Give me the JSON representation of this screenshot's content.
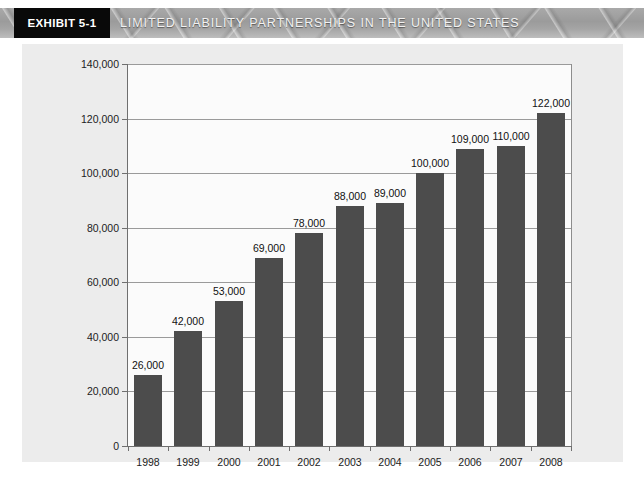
{
  "header": {
    "exhibit_tag": "EXHIBIT 5-1",
    "title": "LIMITED LIABILITY PARTNERSHIPS IN THE UNITED STATES",
    "tag_bg": "#090909",
    "band_bg": "#9b9b9b",
    "title_color": "#f2f2f2"
  },
  "chart_data": {
    "type": "bar",
    "title": "LIMITED LIABILITY PARTNERSHIPS IN THE UNITED STATES",
    "xlabel": "",
    "ylabel": "",
    "categories": [
      "1998",
      "1999",
      "2000",
      "2001",
      "2002",
      "2003",
      "2004",
      "2005",
      "2006",
      "2007",
      "2008"
    ],
    "values": [
      26000,
      42000,
      53000,
      69000,
      78000,
      88000,
      89000,
      100000,
      109000,
      110000,
      122000
    ],
    "value_labels": [
      "26,000",
      "42,000",
      "53,000",
      "69,000",
      "78,000",
      "88,000",
      "89,000",
      "100,000",
      "109,000",
      "110,000",
      "122,000"
    ],
    "ylim": [
      0,
      140000
    ],
    "ytick_values": [
      0,
      20000,
      40000,
      60000,
      80000,
      100000,
      120000,
      140000
    ],
    "ytick_labels": [
      "0",
      "20,000",
      "40,000",
      "60,000",
      "80,000",
      "100,000",
      "120,000",
      "140,000"
    ],
    "grid": true,
    "grid_axis": "y",
    "legend": null,
    "bar_color": "#4c4c4c",
    "plot_bg": "#fbfbfb",
    "panel_bg": "#ececec",
    "axis_color": "#6f6f6f"
  }
}
